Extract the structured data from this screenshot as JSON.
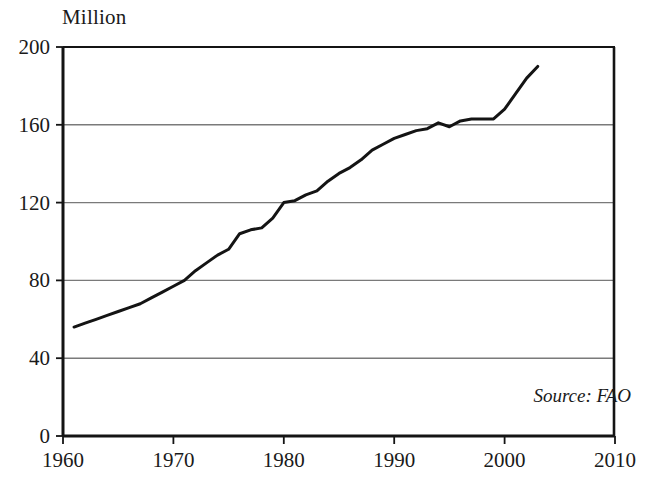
{
  "chart_data": {
    "type": "line",
    "title": "",
    "subtitle": "",
    "xlabel": "",
    "ylabel": "Million",
    "unit_label": "Million",
    "xlim": [
      1960,
      2010
    ],
    "ylim": [
      0,
      200
    ],
    "xticks": [
      1960,
      1970,
      1980,
      1990,
      2000,
      2010
    ],
    "yticks": [
      0,
      40,
      80,
      120,
      160,
      200
    ],
    "xtick_labels": [
      "1960",
      "1970",
      "1980",
      "1990",
      "2000",
      "2010"
    ],
    "ytick_labels": [
      "0",
      "40",
      "80",
      "120",
      "160",
      "200"
    ],
    "grid": true,
    "grid_axis": "y",
    "legend": false,
    "legend_position": "none",
    "annotations": [
      {
        "name": "source-note",
        "text": "Source: FAO",
        "style": "italic",
        "position": "bottom-right-inside-plot"
      }
    ],
    "line_color": "#141414",
    "line_width": 3,
    "grid_color": "#7a7a7a",
    "axis_color": "#141414",
    "background_color": "#ffffff",
    "series": [
      {
        "name": "Production",
        "x": [
          1961,
          1962,
          1963,
          1964,
          1965,
          1966,
          1967,
          1968,
          1969,
          1970,
          1971,
          1972,
          1973,
          1974,
          1975,
          1976,
          1977,
          1978,
          1979,
          1980,
          1981,
          1982,
          1983,
          1984,
          1985,
          1986,
          1987,
          1988,
          1989,
          1990,
          1991,
          1992,
          1993,
          1994,
          1995,
          1996,
          1997,
          1998,
          1999,
          2000,
          2001,
          2002,
          2003
        ],
        "values": [
          56,
          58,
          60,
          62,
          64,
          66,
          68,
          71,
          74,
          77,
          80,
          85,
          89,
          93,
          96,
          104,
          106,
          107,
          112,
          120,
          121,
          124,
          126,
          131,
          135,
          138,
          142,
          147,
          150,
          153,
          155,
          157,
          158,
          161,
          159,
          162,
          163,
          163,
          163,
          168,
          176,
          184,
          190
        ]
      }
    ]
  },
  "axes": {
    "unit_label": "Million",
    "y_tick_labels": [
      "200",
      "160",
      "120",
      "80",
      "40",
      "0"
    ],
    "x_tick_labels": [
      "1960",
      "1970",
      "1980",
      "1990",
      "2000",
      "2010"
    ]
  },
  "source": {
    "text": "Source: FAO"
  }
}
